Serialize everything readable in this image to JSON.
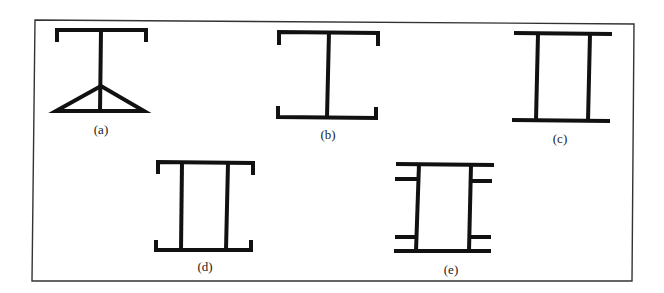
{
  "figure": {
    "type": "cross-section diagrams",
    "panels": [
      {
        "id": "a",
        "label": "(a)",
        "shape": "T-section with top lipped flange and triangular bottom brace"
      },
      {
        "id": "b",
        "label": "(b)",
        "shape": "I-section with lipped flanges, single web"
      },
      {
        "id": "c",
        "label": "(c)",
        "shape": "box section with plain flanges, two webs"
      },
      {
        "id": "d",
        "label": "(d)",
        "shape": "box section with lipped flanges, two webs"
      },
      {
        "id": "e",
        "label": "(e)",
        "shape": "box section with plain flanges, two webs, and side stiffener stubs"
      }
    ]
  }
}
